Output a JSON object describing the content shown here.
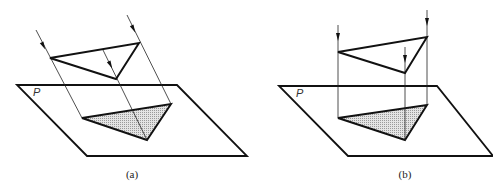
{
  "figure": {
    "panels": [
      {
        "id": "a",
        "caption": "(a)",
        "plane_label": "P",
        "projection": "oblique parallel projection",
        "plane": [
          [
            17,
            85
          ],
          [
            177,
            85
          ],
          [
            247,
            156
          ],
          [
            87,
            156
          ]
        ],
        "object_triangle": [
          [
            50,
            58
          ],
          [
            139,
            43
          ],
          [
            116,
            79
          ]
        ],
        "projected_triangle": [
          [
            82,
            118
          ],
          [
            171,
            104
          ],
          [
            147,
            140
          ]
        ],
        "rays": [
          {
            "from": [
              36,
              30
            ],
            "to": [
              82,
              118
            ],
            "arrow_at": [
              43,
              45
            ]
          },
          {
            "from": [
              127,
              15
            ],
            "to": [
              171,
              104
            ],
            "arrow_at": [
              133,
              28
            ]
          },
          {
            "from": [
              103,
              50
            ],
            "to": [
              147,
              140
            ],
            "arrow_at": [
              110,
              64
            ]
          }
        ],
        "shading_color": "#cfcfcf"
      },
      {
        "id": "b",
        "caption": "(b)",
        "plane_label": "P",
        "projection": "orthographic parallel projection",
        "plane": [
          [
            279,
            86
          ],
          [
            437,
            86
          ],
          [
            493,
            156
          ],
          [
            348,
            156
          ]
        ],
        "object_triangle": [
          [
            338,
            52
          ],
          [
            427,
            37
          ],
          [
            405,
            73
          ]
        ],
        "projected_triangle": [
          [
            338,
            118
          ],
          [
            427,
            105
          ],
          [
            405,
            140
          ]
        ],
        "rays": [
          {
            "from": [
              338,
              25
            ],
            "to": [
              338,
              118
            ],
            "arrow_at": [
              338,
              36
            ]
          },
          {
            "from": [
              427,
              10
            ],
            "to": [
              427,
              105
            ],
            "arrow_at": [
              427,
              21
            ]
          },
          {
            "from": [
              405,
              47
            ],
            "to": [
              405,
              140
            ],
            "arrow_at": [
              405,
              58
            ]
          }
        ],
        "shading_color": "#d6d6d6"
      }
    ],
    "caption_positions": {
      "a": [
        132,
        178
      ],
      "b": [
        405,
        178
      ]
    },
    "plane_label_positions": {
      "a": [
        33,
        96
      ],
      "b": [
        296,
        97
      ]
    }
  }
}
